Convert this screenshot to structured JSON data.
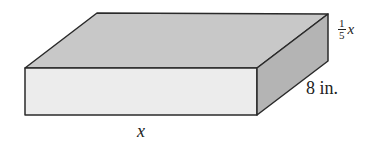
{
  "diagram": {
    "type": "rectangular-prism",
    "colors": {
      "top_face": "#c8c8c8",
      "front_face": "#ececec",
      "side_face": "#b4b4b4",
      "edge": "#2a2a2a"
    },
    "labels": {
      "length": "x",
      "depth": "8 in.",
      "height_numerator": "1",
      "height_denominator": "5",
      "height_variable": "x"
    }
  }
}
